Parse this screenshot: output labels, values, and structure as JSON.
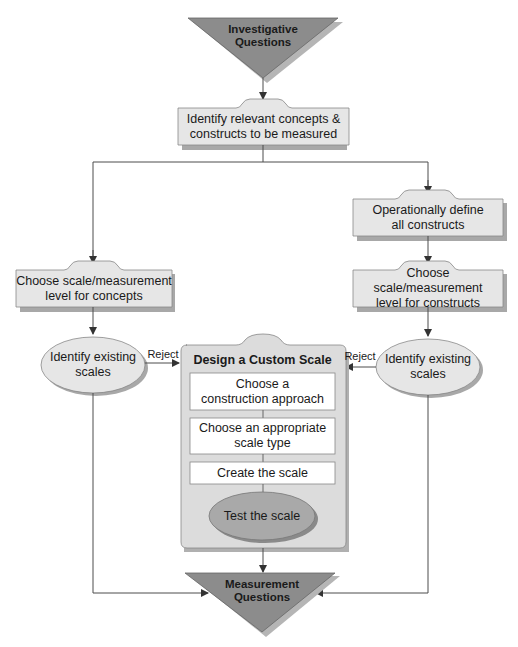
{
  "diagram": {
    "start": {
      "label_line1": "Investigative",
      "label_line2": "Questions"
    },
    "identify_concepts": {
      "line1": "Identify relevant concepts &",
      "line2": "constructs to be measured"
    },
    "operationally_define": {
      "line1": "Operationally define",
      "line2": "all constructs"
    },
    "choose_scale_concepts": {
      "line1": "Choose scale/measurement",
      "line2": "level for concepts"
    },
    "choose_scale_constructs": {
      "line1": "Choose scale/measurement",
      "line2": "level for constructs"
    },
    "identify_existing_left": {
      "line1": "Identify existing",
      "line2": "scales"
    },
    "identify_existing_right": {
      "line1": "Identify existing",
      "line2": "scales"
    },
    "reject_left": "Reject",
    "reject_right": "Reject",
    "custom_scale": {
      "title": "Design a Custom Scale",
      "steps": [
        {
          "line1": "Choose a",
          "line2": "construction approach"
        },
        {
          "line1": "Choose an appropriate",
          "line2": "scale type"
        },
        {
          "line1": "Create the scale",
          "line2": ""
        }
      ],
      "test": "Test the scale"
    },
    "end": {
      "label_line1": "Measurement",
      "label_line2": "Questions"
    }
  },
  "colors": {
    "triangle": "#8c8c8c",
    "triangle_shadow": "#b5b5b5",
    "box_fill": "#e6e6e6",
    "box_shadow": "#a8a8a8",
    "container_fill": "#dcdcdc",
    "inner_box_fill": "#ffffff",
    "test_ellipse_fill": "#a9a9a9",
    "line": "#4d4d4d"
  }
}
